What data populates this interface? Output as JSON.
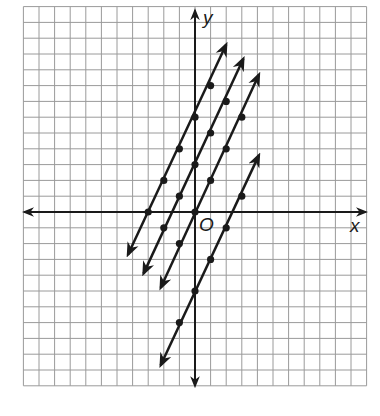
{
  "graph": {
    "origin_px": [
      195,
      212
    ],
    "cell_px": [
      15.6,
      15.8
    ],
    "grid": {
      "xmin": -11,
      "xmax": 11,
      "ymin": -11,
      "ymax": 13,
      "color": "#9a9a9a"
    },
    "axes": {
      "x_label": "x",
      "y_label": "y",
      "origin_label": "O",
      "color": "#1a1a1a"
    }
  },
  "chart_data": {
    "type": "line",
    "title": "",
    "xlabel": "x",
    "ylabel": "y",
    "grid": true,
    "xlim": [
      -11,
      11
    ],
    "ylim": [
      -11,
      13
    ],
    "series": [
      {
        "name": "y = 2x + 6",
        "slope": 2,
        "intercept": 6,
        "points": [
          [
            -3,
            0
          ],
          [
            -2,
            2
          ],
          [
            -1,
            4
          ],
          [
            0,
            6
          ],
          [
            1,
            8
          ]
        ],
        "start": [
          -4.3,
          -2.7
        ],
        "end": [
          2.0,
          10.6
        ]
      },
      {
        "name": "y = 2x + 3",
        "slope": 2,
        "intercept": 3,
        "points": [
          [
            -2,
            -1
          ],
          [
            -1,
            1
          ],
          [
            0,
            3
          ],
          [
            1,
            5
          ],
          [
            2,
            7
          ]
        ],
        "start": [
          -3.3,
          -3.9
        ],
        "end": [
          3.1,
          9.7
        ]
      },
      {
        "name": "y = 2x",
        "slope": 2,
        "intercept": 0,
        "points": [
          [
            -1,
            -2
          ],
          [
            0,
            0
          ],
          [
            1,
            2
          ],
          [
            2,
            4
          ],
          [
            3,
            6
          ]
        ],
        "start": [
          -2.2,
          -4.8
        ],
        "end": [
          4.1,
          8.7
        ]
      },
      {
        "name": "y = 2x - 5",
        "slope": 2,
        "intercept": -5,
        "points": [
          [
            -1,
            -7
          ],
          [
            0,
            -5
          ],
          [
            1,
            -3
          ],
          [
            2,
            -1
          ],
          [
            3,
            1
          ]
        ],
        "start": [
          -2.2,
          -9.7
        ],
        "end": [
          4.1,
          3.6
        ]
      }
    ]
  }
}
